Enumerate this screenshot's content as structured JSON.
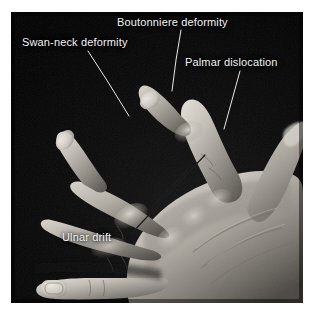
{
  "figure": {
    "kind": "clinical-photograph",
    "rendering": "grayscale photograph on white page margin",
    "plate": {
      "left": 11,
      "top": 12,
      "width": 292,
      "height": 291,
      "background_color": "#050505",
      "page_background_color": "#ffffff"
    }
  },
  "annotations": {
    "text_color": "#f2f2f2",
    "leader_line_color": "#e8e8e8",
    "items": [
      {
        "id": "boutonniere",
        "label": "Boutonniere deformity",
        "text_x": 117,
        "text_y": 16,
        "leader": [
          [
            181,
            30
          ],
          [
            176,
            60
          ],
          [
            172,
            91
          ]
        ]
      },
      {
        "id": "swan-neck",
        "label": "Swan-neck deformity",
        "text_x": 22,
        "text_y": 36,
        "leader": [
          [
            88,
            51
          ],
          [
            108,
            82
          ],
          [
            129,
            116
          ]
        ]
      },
      {
        "id": "palmar",
        "label": "Palmar dislocation",
        "text_x": 185,
        "text_y": 56,
        "leader": [
          [
            240,
            71
          ],
          [
            232,
            100
          ],
          [
            224,
            129
          ]
        ]
      },
      {
        "id": "ulnar-drift",
        "label": "Ulnar drift",
        "text_x": 62,
        "text_y": 231,
        "leader_main": [
          [
            131,
            234
          ],
          [
            146,
            218
          ],
          [
            172,
            190
          ],
          [
            205,
            155
          ]
        ],
        "leader_branch": [
          [
            152,
            207
          ],
          [
            168,
            190
          ],
          [
            188,
            169
          ]
        ]
      }
    ]
  },
  "chart_data": {
    "type": "table",
    "categories": [
      "Boutonniere deformity",
      "Swan-neck deformity",
      "Palmar dislocation",
      "Ulnar drift"
    ],
    "values": [
      1,
      1,
      1,
      1
    ]
  }
}
